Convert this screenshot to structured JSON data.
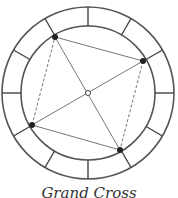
{
  "figure": {
    "divisions": 12,
    "points_count": 4,
    "caption": "Grand Cross",
    "stroke_color": "#444444",
    "point_color": "#222222"
  }
}
